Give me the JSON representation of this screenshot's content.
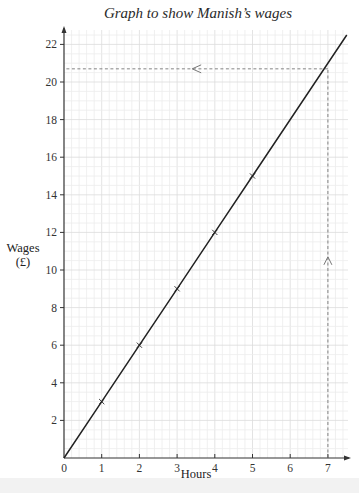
{
  "chart_data": {
    "type": "line",
    "title": "Graph to show Manish’s wages",
    "xlabel": "Hours",
    "ylabel": "Wages",
    "ylabel_unit": "(£)",
    "xlim": [
      0,
      7.5
    ],
    "ylim": [
      0,
      23
    ],
    "x_ticks": [
      0,
      1,
      2,
      3,
      4,
      5,
      6,
      7
    ],
    "y_ticks": [
      2,
      4,
      6,
      8,
      10,
      12,
      14,
      16,
      18,
      20,
      22
    ],
    "grid": true,
    "series": [
      {
        "name": "Wages",
        "x": [
          0,
          1,
          2,
          3,
          4,
          5,
          7.5
        ],
        "y": [
          0,
          3,
          6,
          9,
          12,
          15,
          22.5
        ],
        "marked_points": [
          [
            1,
            3
          ],
          [
            2,
            6
          ],
          [
            3,
            9
          ],
          [
            4,
            12
          ],
          [
            5,
            15
          ]
        ],
        "color": "#222222"
      }
    ],
    "annotations": [
      {
        "type": "dashed-vertical",
        "x": 7,
        "from_y": 0,
        "to_y": 20.7,
        "arrow": "up"
      },
      {
        "type": "dashed-horizontal",
        "y": 20.7,
        "from_x": 7,
        "to_x": 0,
        "arrow": "left"
      }
    ]
  },
  "labels": {
    "title": "Graph to show Manish’s wages",
    "xlabel": "Hours",
    "ylabel_line1": "Wages",
    "ylabel_line2": "(£)",
    "x_ticks": [
      "0",
      "1",
      "2",
      "3",
      "4",
      "5",
      "6",
      "7"
    ],
    "y_ticks": [
      "2",
      "4",
      "6",
      "8",
      "10",
      "12",
      "14",
      "16",
      "18",
      "20",
      "22"
    ]
  },
  "colors": {
    "grid_minor": "#ececec",
    "grid_major": "#dcdcdc",
    "axis": "#333333",
    "line": "#222222",
    "dashed": "#777777"
  }
}
